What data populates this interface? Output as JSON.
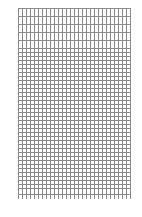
{
  "grid": {
    "left": 18,
    "top": 8,
    "width": 112,
    "height": 191,
    "line_color": "#8a8a8a",
    "vertical_spacing": 4,
    "horizontal_sections": [
      {
        "from": 0,
        "to": 40,
        "spacing": 8
      },
      {
        "from": 40,
        "to": 180,
        "spacing": 4
      },
      {
        "from": 180,
        "to": 191,
        "spacing": 6
      }
    ]
  }
}
